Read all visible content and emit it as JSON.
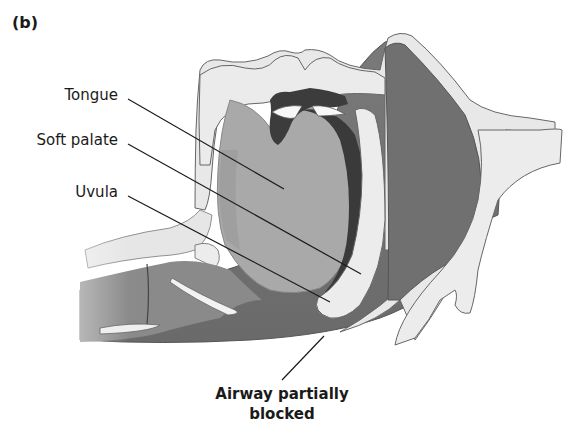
{
  "figure": {
    "panel_label": "(b)",
    "title_implied": "Sagittal view of mouth and throat during sleep",
    "labels": {
      "tongue": "Tongue",
      "soft_palate": "Soft palate",
      "uvula": "Uvula",
      "airway_line1": "Airway partially",
      "airway_line2": "blocked"
    },
    "colors": {
      "background": "#ffffff",
      "soft_tissue_light": "#e6e6e6",
      "tongue_mid": "#a8a8a8",
      "airway_dark": "#6e6e6e",
      "muscle_dark": "#3c3c3c",
      "outline": "#555555",
      "leader_line": "#1a1a1a"
    }
  }
}
